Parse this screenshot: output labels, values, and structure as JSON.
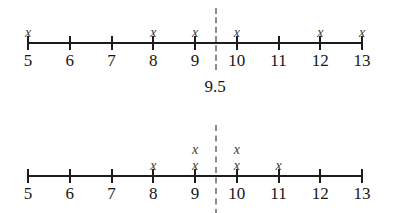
{
  "figure": {
    "type": "dot-plot-pair",
    "axis": {
      "min": 5,
      "max": 13,
      "tick_labels": [
        "5",
        "6",
        "7",
        "8",
        "9",
        "10",
        "11",
        "12",
        "13"
      ],
      "tick_values": [
        5,
        6,
        7,
        8,
        9,
        10,
        11,
        12,
        13
      ]
    },
    "divider": {
      "value": 9.5,
      "label": "9.5",
      "style": "dashed",
      "color": "#8c8c8c"
    },
    "marker_glyph": "x",
    "plots": [
      {
        "name": "top-dot-plot",
        "show_divider_label": true,
        "stacks": [
          {
            "value": 5,
            "count": 1
          },
          {
            "value": 6,
            "count": 0
          },
          {
            "value": 7,
            "count": 0
          },
          {
            "value": 8,
            "count": 1
          },
          {
            "value": 9,
            "count": 1
          },
          {
            "value": 10,
            "count": 1
          },
          {
            "value": 11,
            "count": 0
          },
          {
            "value": 12,
            "count": 1
          },
          {
            "value": 13,
            "count": 1
          }
        ],
        "total_count": 6
      },
      {
        "name": "bottom-dot-plot",
        "show_divider_label": false,
        "stacks": [
          {
            "value": 5,
            "count": 0
          },
          {
            "value": 6,
            "count": 0
          },
          {
            "value": 7,
            "count": 0
          },
          {
            "value": 8,
            "count": 1
          },
          {
            "value": 9,
            "count": 2
          },
          {
            "value": 10,
            "count": 2
          },
          {
            "value": 11,
            "count": 1
          },
          {
            "value": 12,
            "count": 0
          },
          {
            "value": 13,
            "count": 0
          }
        ],
        "total_count": 6
      }
    ]
  },
  "chart_data": {
    "type": "scatter",
    "title": "",
    "xlabel": "",
    "ylabel": "",
    "xlim": [
      5,
      13
    ],
    "grid": false,
    "legend": null,
    "categories": [
      "5",
      "6",
      "7",
      "8",
      "9",
      "10",
      "11",
      "12",
      "13"
    ],
    "annotations": [
      {
        "text": "9.5",
        "x": 9.5,
        "kind": "vertical-dashed-reference-line"
      }
    ],
    "series": [
      {
        "name": "top-dot-plot",
        "x": [
          5,
          6,
          7,
          8,
          9,
          10,
          11,
          12,
          13
        ],
        "values": [
          1,
          0,
          0,
          1,
          1,
          1,
          0,
          1,
          1
        ]
      },
      {
        "name": "bottom-dot-plot",
        "x": [
          5,
          6,
          7,
          8,
          9,
          10,
          11,
          12,
          13
        ],
        "values": [
          0,
          0,
          0,
          1,
          2,
          2,
          1,
          0,
          0
        ]
      }
    ]
  }
}
